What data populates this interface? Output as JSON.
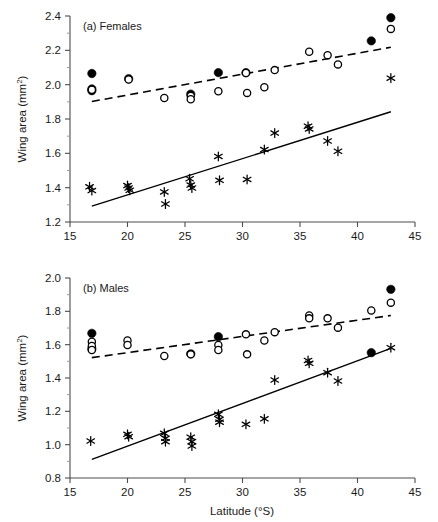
{
  "figure": {
    "xlabel": "Latitude (°S)",
    "ylabel_main": "Wing area (mm",
    "ylabel_sup": "2",
    "ylabel_tail": ")"
  },
  "chart_data": [
    {
      "type": "scatter",
      "title": "(a) Females",
      "xlabel": "Latitude (°S)",
      "ylabel": "Wing area (mm2)",
      "xlim": [
        15,
        45
      ],
      "ylim": [
        1.2,
        2.4
      ],
      "xticks": [
        15,
        20,
        25,
        30,
        35,
        40,
        45
      ],
      "yticks": [
        1.2,
        1.4,
        1.6,
        1.8,
        2.0,
        2.2,
        2.4
      ],
      "xtick_labels": [
        "15",
        "20",
        "25",
        "30",
        "35",
        "40",
        "45"
      ],
      "ytick_labels": [
        "1.2",
        "1.4",
        "1.6",
        "1.8",
        "2.0",
        "2.2",
        "2.4"
      ],
      "grid": false,
      "legend": "none",
      "series": [
        {
          "name": "filled-circle",
          "marker": "filled-circle",
          "points": [
            [
              16.9,
              2.065
            ],
            [
              16.9,
              1.975
            ],
            [
              16.9,
              1.965
            ],
            [
              20.1,
              2.035
            ],
            [
              25.5,
              1.945
            ],
            [
              27.9,
              2.07
            ],
            [
              30.3,
              2.07
            ],
            [
              41.2,
              2.255
            ],
            [
              42.9,
              2.39
            ]
          ]
        },
        {
          "name": "open-circle",
          "marker": "open-circle",
          "points": [
            [
              16.9,
              1.97
            ],
            [
              20.1,
              2.03
            ],
            [
              23.2,
              1.922
            ],
            [
              25.5,
              1.935
            ],
            [
              25.5,
              1.915
            ],
            [
              27.9,
              1.962
            ],
            [
              30.3,
              2.068
            ],
            [
              30.4,
              1.952
            ],
            [
              31.9,
              1.985
            ],
            [
              32.8,
              2.085
            ],
            [
              35.8,
              2.192
            ],
            [
              37.4,
              2.172
            ],
            [
              38.3,
              2.118
            ],
            [
              42.9,
              2.325
            ]
          ]
        },
        {
          "name": "asterisk",
          "marker": "asterisk",
          "points": [
            [
              16.7,
              1.405
            ],
            [
              16.9,
              1.383
            ],
            [
              20.0,
              1.412
            ],
            [
              20.1,
              1.398
            ],
            [
              20.2,
              1.385
            ],
            [
              23.2,
              1.375
            ],
            [
              23.3,
              1.305
            ],
            [
              25.4,
              1.452
            ],
            [
              25.5,
              1.415
            ],
            [
              25.6,
              1.398
            ],
            [
              27.9,
              1.582
            ],
            [
              28.0,
              1.443
            ],
            [
              30.4,
              1.448
            ],
            [
              31.9,
              1.622
            ],
            [
              32.8,
              1.718
            ],
            [
              35.7,
              1.758
            ],
            [
              35.8,
              1.742
            ],
            [
              37.4,
              1.672
            ],
            [
              38.3,
              1.612
            ],
            [
              42.9,
              2.038
            ]
          ]
        }
      ],
      "fits": [
        {
          "name": "open-circle-trend",
          "style": "dashed",
          "x": [
            16.9,
            42.9
          ],
          "y": [
            1.902,
            2.218
          ]
        },
        {
          "name": "asterisk-trend",
          "style": "solid",
          "x": [
            16.9,
            42.9
          ],
          "y": [
            1.292,
            1.842
          ]
        }
      ]
    },
    {
      "type": "scatter",
      "title": "(b) Males",
      "xlabel": "Latitude (°S)",
      "ylabel": "Wing area (mm2)",
      "xlim": [
        15,
        45
      ],
      "ylim": [
        0.8,
        2.0
      ],
      "xticks": [
        15,
        20,
        25,
        30,
        35,
        40,
        45
      ],
      "yticks": [
        0.8,
        1.0,
        1.2,
        1.4,
        1.6,
        1.8,
        2.0
      ],
      "xtick_labels": [
        "15",
        "20",
        "25",
        "30",
        "35",
        "40",
        "45"
      ],
      "ytick_labels": [
        "0.8",
        "1.0",
        "1.2",
        "1.4",
        "1.6",
        "1.8",
        "2.0"
      ],
      "grid": false,
      "legend": "none",
      "series": [
        {
          "name": "filled-circle",
          "marker": "filled-circle",
          "points": [
            [
              16.9,
              1.668
            ],
            [
              16.9,
              1.575
            ],
            [
              25.5,
              1.545
            ],
            [
              27.9,
              1.648
            ],
            [
              41.2,
              1.552
            ],
            [
              42.9,
              1.932
            ]
          ]
        },
        {
          "name": "open-circle",
          "marker": "open-circle",
          "points": [
            [
              16.9,
              1.618
            ],
            [
              16.9,
              1.592
            ],
            [
              16.9,
              1.568
            ],
            [
              20.0,
              1.625
            ],
            [
              20.0,
              1.598
            ],
            [
              23.2,
              1.532
            ],
            [
              25.5,
              1.542
            ],
            [
              27.9,
              1.598
            ],
            [
              27.9,
              1.568
            ],
            [
              30.3,
              1.662
            ],
            [
              30.4,
              1.542
            ],
            [
              31.9,
              1.625
            ],
            [
              32.8,
              1.675
            ],
            [
              35.8,
              1.775
            ],
            [
              35.8,
              1.758
            ],
            [
              37.4,
              1.758
            ],
            [
              38.3,
              1.702
            ],
            [
              41.2,
              1.805
            ],
            [
              42.9,
              1.852
            ]
          ]
        },
        {
          "name": "asterisk",
          "marker": "asterisk",
          "points": [
            [
              16.8,
              1.022
            ],
            [
              20.0,
              1.062
            ],
            [
              20.1,
              1.048
            ],
            [
              23.2,
              1.068
            ],
            [
              23.3,
              1.038
            ],
            [
              23.3,
              1.018
            ],
            [
              25.5,
              1.045
            ],
            [
              25.6,
              1.018
            ],
            [
              25.6,
              0.992
            ],
            [
              27.9,
              1.182
            ],
            [
              28.0,
              1.152
            ],
            [
              28.0,
              1.135
            ],
            [
              30.3,
              1.122
            ],
            [
              31.9,
              1.155
            ],
            [
              32.8,
              1.388
            ],
            [
              35.7,
              1.505
            ],
            [
              35.8,
              1.488
            ],
            [
              37.4,
              1.432
            ],
            [
              38.3,
              1.382
            ],
            [
              42.9,
              1.582
            ]
          ]
        }
      ],
      "fits": [
        {
          "name": "open-circle-trend",
          "style": "dashed",
          "x": [
            16.9,
            42.9
          ],
          "y": [
            1.522,
            1.775
          ]
        },
        {
          "name": "asterisk-trend",
          "style": "solid",
          "x": [
            16.9,
            42.9
          ],
          "y": [
            0.912,
            1.578
          ]
        }
      ]
    }
  ]
}
